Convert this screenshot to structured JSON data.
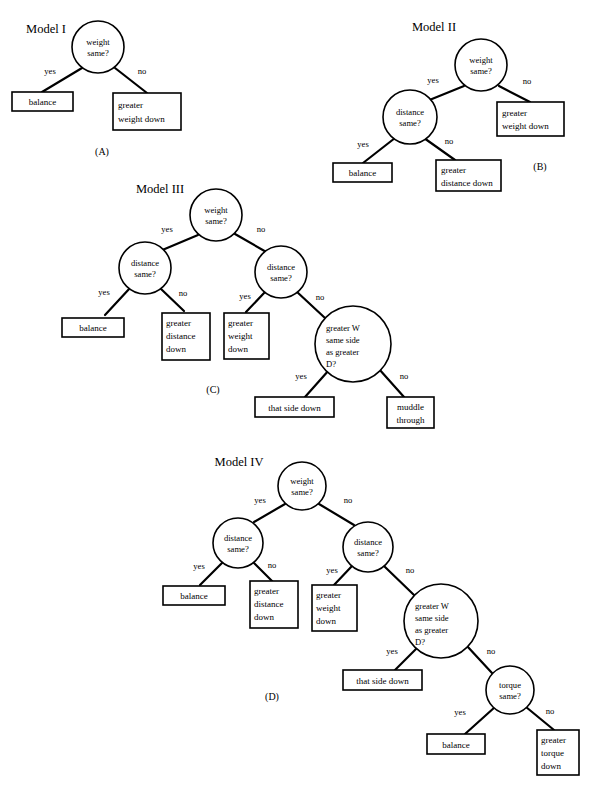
{
  "figure": {
    "background": "#ffffff",
    "ink": "#000000",
    "edge_labels": {
      "yes": "yes",
      "no": "no"
    },
    "panels": [
      {
        "id": "A",
        "title": "Model I",
        "panel_label": "(A)",
        "nodes": [
          {
            "id": "w",
            "type": "decision",
            "lines": [
              "weight",
              "same?"
            ]
          },
          {
            "id": "bal",
            "type": "outcome",
            "lines": [
              "balance"
            ]
          },
          {
            "id": "gwd",
            "type": "outcome",
            "lines": [
              "greater",
              "weight down"
            ]
          }
        ],
        "edges": [
          {
            "from": "w",
            "to": "bal",
            "label": "yes"
          },
          {
            "from": "w",
            "to": "gwd",
            "label": "no"
          }
        ]
      },
      {
        "id": "B",
        "title": "Model II",
        "panel_label": "(B)",
        "nodes": [
          {
            "id": "w",
            "type": "decision",
            "lines": [
              "weight",
              "same?"
            ]
          },
          {
            "id": "d",
            "type": "decision",
            "lines": [
              "distance",
              "same?"
            ]
          },
          {
            "id": "gwd",
            "type": "outcome",
            "lines": [
              "greater",
              "weight down"
            ]
          },
          {
            "id": "bal",
            "type": "outcome",
            "lines": [
              "balance"
            ]
          },
          {
            "id": "gdd",
            "type": "outcome",
            "lines": [
              "greater",
              "distance down"
            ]
          }
        ],
        "edges": [
          {
            "from": "w",
            "to": "d",
            "label": "yes"
          },
          {
            "from": "w",
            "to": "gwd",
            "label": "no"
          },
          {
            "from": "d",
            "to": "bal",
            "label": "yes"
          },
          {
            "from": "d",
            "to": "gdd",
            "label": "no"
          }
        ]
      },
      {
        "id": "C",
        "title": "Model III",
        "panel_label": "(C)",
        "nodes": [
          {
            "id": "w",
            "type": "decision",
            "lines": [
              "weight",
              "same?"
            ]
          },
          {
            "id": "dL",
            "type": "decision",
            "lines": [
              "distance",
              "same?"
            ]
          },
          {
            "id": "dR",
            "type": "decision",
            "lines": [
              "distance",
              "same?"
            ]
          },
          {
            "id": "gw",
            "type": "decision",
            "lines": [
              "greater W",
              "same side",
              "as greater",
              "D?"
            ]
          },
          {
            "id": "bal",
            "type": "outcome",
            "lines": [
              "balance"
            ]
          },
          {
            "id": "gdd",
            "type": "outcome",
            "lines": [
              "greater",
              "distance",
              "down"
            ]
          },
          {
            "id": "gwd",
            "type": "outcome",
            "lines": [
              "greater",
              "weight",
              "down"
            ]
          },
          {
            "id": "tsd",
            "type": "outcome",
            "lines": [
              "that side down"
            ]
          },
          {
            "id": "mud",
            "type": "outcome",
            "lines": [
              "muddle",
              "through"
            ]
          }
        ],
        "edges": [
          {
            "from": "w",
            "to": "dL",
            "label": "yes"
          },
          {
            "from": "w",
            "to": "dR",
            "label": "no"
          },
          {
            "from": "dL",
            "to": "bal",
            "label": "yes"
          },
          {
            "from": "dL",
            "to": "gdd",
            "label": "no"
          },
          {
            "from": "dR",
            "to": "gwd",
            "label": "yes"
          },
          {
            "from": "dR",
            "to": "gw",
            "label": "no"
          },
          {
            "from": "gw",
            "to": "tsd",
            "label": "yes"
          },
          {
            "from": "gw",
            "to": "mud",
            "label": "no"
          }
        ]
      },
      {
        "id": "D",
        "title": "Model IV",
        "panel_label": "(D)",
        "nodes": [
          {
            "id": "w",
            "type": "decision",
            "lines": [
              "weight",
              "same?"
            ]
          },
          {
            "id": "dL",
            "type": "decision",
            "lines": [
              "distance",
              "same?"
            ]
          },
          {
            "id": "dR",
            "type": "decision",
            "lines": [
              "distance",
              "same?"
            ]
          },
          {
            "id": "gw",
            "type": "decision",
            "lines": [
              "greater W",
              "same side",
              "as greater",
              "D?"
            ]
          },
          {
            "id": "tq",
            "type": "decision",
            "lines": [
              "torque",
              "same?"
            ]
          },
          {
            "id": "bal",
            "type": "outcome",
            "lines": [
              "balance"
            ]
          },
          {
            "id": "gdd",
            "type": "outcome",
            "lines": [
              "greater",
              "distance",
              "down"
            ]
          },
          {
            "id": "gwd",
            "type": "outcome",
            "lines": [
              "greater",
              "weight",
              "down"
            ]
          },
          {
            "id": "tsd",
            "type": "outcome",
            "lines": [
              "that side down"
            ]
          },
          {
            "id": "bal2",
            "type": "outcome",
            "lines": [
              "balance"
            ]
          },
          {
            "id": "gtd",
            "type": "outcome",
            "lines": [
              "greater",
              "torque",
              "down"
            ]
          }
        ],
        "edges": [
          {
            "from": "w",
            "to": "dL",
            "label": "yes"
          },
          {
            "from": "w",
            "to": "dR",
            "label": "no"
          },
          {
            "from": "dL",
            "to": "bal",
            "label": "yes"
          },
          {
            "from": "dL",
            "to": "gdd",
            "label": "no"
          },
          {
            "from": "dR",
            "to": "gwd",
            "label": "yes"
          },
          {
            "from": "dR",
            "to": "gw",
            "label": "no"
          },
          {
            "from": "gw",
            "to": "tsd",
            "label": "yes"
          },
          {
            "from": "gw",
            "to": "tq",
            "label": "no"
          },
          {
            "from": "tq",
            "to": "bal2",
            "label": "yes"
          },
          {
            "from": "tq",
            "to": "gtd",
            "label": "no"
          }
        ]
      }
    ]
  },
  "labels": {
    "A": {
      "title": "Model I",
      "panel": "(A)",
      "w1": "weight",
      "w2": "same?",
      "e_yes": "yes",
      "e_no": "no",
      "bal": "balance",
      "gwd1": "greater",
      "gwd2": "weight down"
    },
    "B": {
      "title": "Model II",
      "panel": "(B)",
      "w1": "weight",
      "w2": "same?",
      "d1": "distance",
      "d2": "same?",
      "e_yes": "yes",
      "e_no": "no",
      "gwd1": "greater",
      "gwd2": "weight down",
      "bal": "balance",
      "gdd1": "greater",
      "gdd2": "distance down"
    },
    "C": {
      "title": "Model III",
      "panel": "(C)",
      "w1": "weight",
      "w2": "same?",
      "dL1": "distance",
      "dL2": "same?",
      "dR1": "distance",
      "dR2": "same?",
      "gw1": "greater W",
      "gw2": "same side",
      "gw3": "as greater",
      "gw4": "D?",
      "e_yes": "yes",
      "e_no": "no",
      "bal": "balance",
      "gdd1": "greater",
      "gdd2": "distance",
      "gdd3": "down",
      "gwd1": "greater",
      "gwd2": "weight",
      "gwd3": "down",
      "tsd": "that side down",
      "mud1": "muddle",
      "mud2": "through"
    },
    "D": {
      "title": "Model IV",
      "panel": "(D)",
      "w1": "weight",
      "w2": "same?",
      "dL1": "distance",
      "dL2": "same?",
      "dR1": "distance",
      "dR2": "same?",
      "gw1": "greater W",
      "gw2": "same side",
      "gw3": "as greater",
      "gw4": "D?",
      "tq1": "torque",
      "tq2": "same?",
      "e_yes": "yes",
      "e_no": "no",
      "bal": "balance",
      "gdd1": "greater",
      "gdd2": "distance",
      "gdd3": "down",
      "gwd1": "greater",
      "gwd2": "weight",
      "gwd3": "down",
      "tsd": "that side down",
      "bal2": "balance",
      "gtd1": "greater",
      "gtd2": "torque",
      "gtd3": "down"
    }
  }
}
